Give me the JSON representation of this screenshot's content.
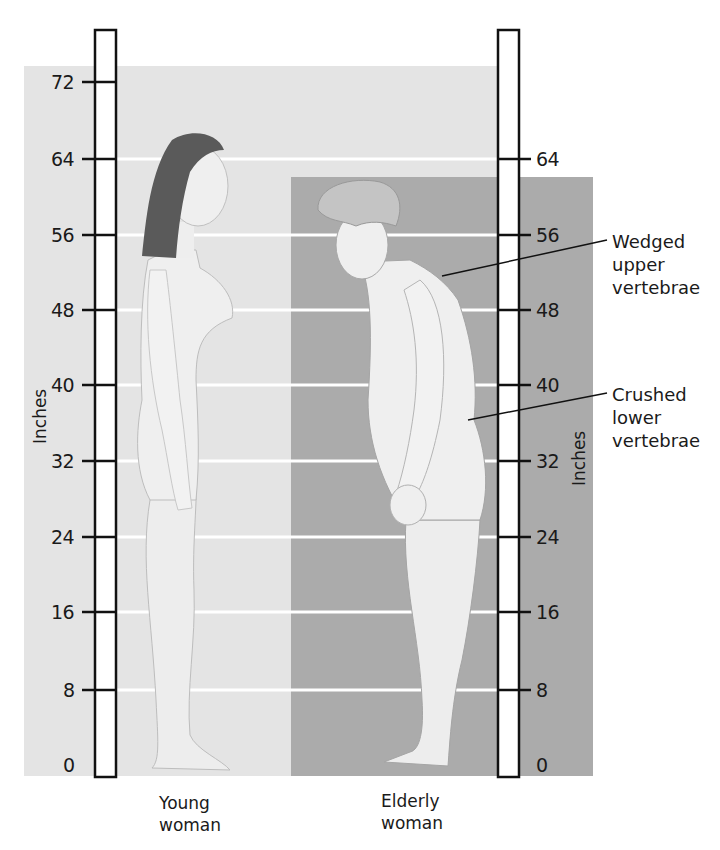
{
  "figure": {
    "unit_label": "Inches",
    "ticks": [
      0,
      8,
      16,
      24,
      32,
      40,
      48,
      56,
      64,
      72
    ],
    "left_ruler": {
      "labels": [
        "72",
        "64",
        "56",
        "48",
        "40",
        "32",
        "24",
        "16",
        "8",
        "0"
      ],
      "axis_label": "Inches"
    },
    "right_ruler": {
      "labels": [
        "64",
        "56",
        "48",
        "40",
        "32",
        "24",
        "16",
        "8",
        "0"
      ],
      "axis_label": "Inches"
    },
    "subjects": [
      {
        "caption_line1": "Young",
        "caption_line2": "woman"
      },
      {
        "caption_line1": "Elderly",
        "caption_line2": "woman"
      }
    ],
    "callouts": [
      {
        "line1": "Wedged",
        "line2": "upper",
        "line3": "vertebrae"
      },
      {
        "line1": "Crushed",
        "line2": "lower",
        "line3": "vertebrae"
      }
    ],
    "colors": {
      "background": "#ffffff",
      "young_panel": "#e4e4e4",
      "elderly_panel": "#ababab",
      "gridline": "#ffffff",
      "ruler_stroke": "#111111",
      "skin": "#efefef",
      "young_hair": "#5a5a5a",
      "elderly_hair": "#c4c4c4"
    }
  }
}
